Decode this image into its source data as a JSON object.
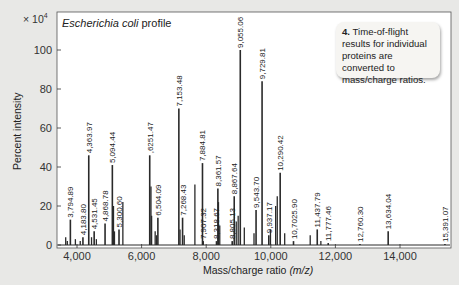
{
  "chart_data": {
    "type": "bar",
    "subtype": "mass-spectrum",
    "title": "Escherichia coli profile",
    "title_italic_part": "Escherichia coli",
    "title_plain_part": " profile",
    "xlabel": "Mass/charge ratio",
    "xlabel_unit": "(m/z)",
    "ylabel": "Percent intensity",
    "y_scale_label": "× 10",
    "y_scale_exponent": "4",
    "xlim": [
      3600,
      15500
    ],
    "ylim": [
      0,
      110
    ],
    "x_ticks": [
      4000,
      6000,
      8000,
      10000,
      12000,
      14000
    ],
    "x_tick_labels": [
      "4,000",
      "6,000",
      "8,000",
      "10,000",
      "12,000",
      "14,000"
    ],
    "y_ticks": [
      0,
      20,
      40,
      60,
      80,
      100
    ],
    "y_tick_labels": [
      "0",
      "20",
      "40",
      "60",
      "80",
      "100"
    ],
    "grid": false,
    "labeled_peaks": [
      {
        "mz": 3794.89,
        "label": "3,794.89",
        "intensity": 13
      },
      {
        "mz": 4183.8,
        "label": "4,183.80",
        "intensity": 4
      },
      {
        "mz": 4363.97,
        "label": "4,363.97",
        "intensity": 46
      },
      {
        "mz": 4531.45,
        "label": "4,531.45",
        "intensity": 7
      },
      {
        "mz": 4868.78,
        "label": "4,868.78",
        "intensity": 11
      },
      {
        "mz": 5094.44,
        "label": "5,094.44",
        "intensity": 41
      },
      {
        "mz": 5300.6,
        "label": "5,300.60",
        "intensity": 8
      },
      {
        "mz": 6251.47,
        "label": ",6251.47",
        "intensity": 46
      },
      {
        "mz": 6504.09,
        "label": "6,504.09",
        "intensity": 14
      },
      {
        "mz": 7153.48,
        "label": "7,153.48",
        "intensity": 70
      },
      {
        "mz": 7268.43,
        "label": "7,268.43",
        "intensity": 14
      },
      {
        "mz": 7884.81,
        "label": "7,884.81",
        "intensity": 42
      },
      {
        "mz": 7907.32,
        "label": "7,907.32",
        "intensity": 2
      },
      {
        "mz": 8318.67,
        "label": "8,318.67",
        "intensity": 2
      },
      {
        "mz": 8361.57,
        "label": "8,361.57",
        "intensity": 29
      },
      {
        "mz": 8805.13,
        "label": "8,805.13",
        "intensity": 2
      },
      {
        "mz": 8867.64,
        "label": "8,867.64",
        "intensity": 25
      },
      {
        "mz": 9055.06,
        "label": "9,055.06",
        "intensity": 100
      },
      {
        "mz": 9543.7,
        "label": "9,543.70",
        "intensity": 18
      },
      {
        "mz": 9729.81,
        "label": "9,729.81",
        "intensity": 84
      },
      {
        "mz": 9937.17,
        "label": "9,937.17",
        "intensity": 5
      },
      {
        "mz": 10290.42,
        "label": "10,290.42",
        "intensity": 37
      },
      {
        "mz": 10702.9,
        "label": "10,7025.90",
        "intensity": 2
      },
      {
        "mz": 11437.79,
        "label": "11,437.79",
        "intensity": 8
      },
      {
        "mz": 11777.46,
        "label": "11,777.46",
        "intensity": 1
      },
      {
        "mz": 12760.3,
        "label": "12,760.30",
        "intensity": 0.5
      },
      {
        "mz": 13634.04,
        "label": "13,634.04",
        "intensity": 7
      },
      {
        "mz": 15391.07,
        "label": "15,391.07",
        "intensity": 0.5
      }
    ],
    "unlabeled_peaks": [
      {
        "mz": 3650,
        "intensity": 4
      },
      {
        "mz": 3700,
        "intensity": 2
      },
      {
        "mz": 3950,
        "intensity": 3
      },
      {
        "mz": 4100,
        "intensity": 2
      },
      {
        "mz": 4450,
        "intensity": 4
      },
      {
        "mz": 4600,
        "intensity": 3
      },
      {
        "mz": 5130,
        "intensity": 20
      },
      {
        "mz": 5160,
        "intensity": 7
      },
      {
        "mz": 5420,
        "intensity": 22
      },
      {
        "mz": 6290,
        "intensity": 30
      },
      {
        "mz": 6310,
        "intensity": 15
      },
      {
        "mz": 6420,
        "intensity": 7
      },
      {
        "mz": 6460,
        "intensity": 5
      },
      {
        "mz": 7190,
        "intensity": 8
      },
      {
        "mz": 7320,
        "intensity": 5
      },
      {
        "mz": 7650,
        "intensity": 31
      },
      {
        "mz": 8380,
        "intensity": 22
      },
      {
        "mz": 8420,
        "intensity": 10
      },
      {
        "mz": 8930,
        "intensity": 12
      },
      {
        "mz": 8990,
        "intensity": 15
      },
      {
        "mz": 9180,
        "intensity": 9
      },
      {
        "mz": 9480,
        "intensity": 6
      },
      {
        "mz": 9990,
        "intensity": 8
      },
      {
        "mz": 10150,
        "intensity": 20
      },
      {
        "mz": 10200,
        "intensity": 25
      },
      {
        "mz": 10430,
        "intensity": 6
      },
      {
        "mz": 11220,
        "intensity": 5
      },
      {
        "mz": 11550,
        "intensity": 2
      }
    ]
  },
  "annotation": {
    "step_number": "4.",
    "text": " Time-of-flight results for individual proteins are converted to mass/charge ratios."
  },
  "colors": {
    "background": "#e8e8e6",
    "plot_background": "#ffffff",
    "peak_color": "#2a2a2a",
    "axis_color": "#333333",
    "callout_background": "#f6f5f2"
  }
}
